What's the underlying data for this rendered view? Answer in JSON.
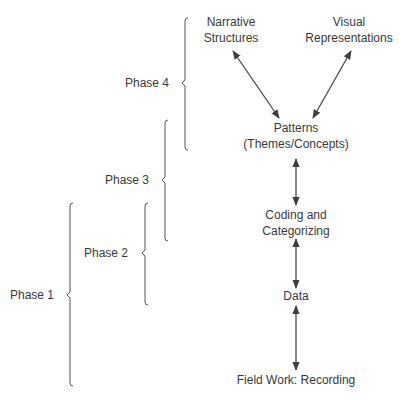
{
  "diagram": {
    "nodes": {
      "narrative": {
        "line1": "Narrative",
        "line2": "Structures"
      },
      "visual": {
        "line1": "Visual",
        "line2": "Representations"
      },
      "patterns": {
        "line1": "Patterns",
        "line2": "(Themes/Concepts)"
      },
      "coding": {
        "line1": "Coding and",
        "line2": "Categorizing"
      },
      "data": {
        "line1": "Data"
      },
      "fieldwork": {
        "line1": "Field Work: Recording"
      }
    },
    "phases": [
      {
        "label": "Phase 4"
      },
      {
        "label": "Phase 3"
      },
      {
        "label": "Phase 2"
      },
      {
        "label": "Phase 1"
      }
    ],
    "edges": [
      {
        "from": "patterns",
        "to": "narrative",
        "type": "bidirectional"
      },
      {
        "from": "patterns",
        "to": "visual",
        "type": "bidirectional"
      },
      {
        "from": "coding",
        "to": "patterns",
        "type": "bidirectional"
      },
      {
        "from": "data",
        "to": "coding",
        "type": "bidirectional"
      },
      {
        "from": "fieldwork",
        "to": "data",
        "type": "bidirectional"
      }
    ],
    "colors": {
      "line": "#4a4a4a",
      "text": "#3a3a3a"
    }
  }
}
